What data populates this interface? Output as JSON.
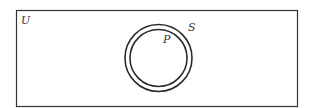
{
  "diagram": {
    "type": "venn",
    "universe": {
      "label": "U"
    },
    "sets": [
      {
        "label": "S",
        "relation": "outer circle"
      },
      {
        "label": "P",
        "relation": "inner circle, subset of S"
      }
    ]
  },
  "colors": {
    "stroke": "#2a2a2a",
    "background": "#ffffff"
  }
}
